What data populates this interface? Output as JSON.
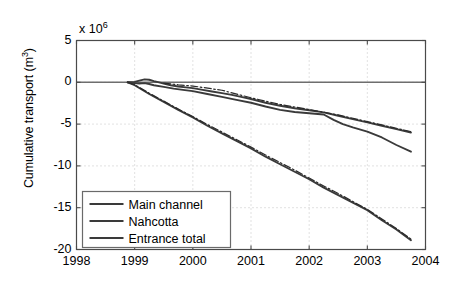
{
  "chart_data": {
    "type": "line",
    "title": "",
    "xlabel": "",
    "ylabel": "Cumulative transport (m",
    "ylabel_sup": "3",
    "ylabel_close": ")",
    "y_multiplier_prefix": "x 10",
    "y_multiplier_exp": "6",
    "xlim": [
      1998,
      2004
    ],
    "ylim": [
      -20,
      5
    ],
    "xticks": [
      "1998",
      "1999",
      "2000",
      "2001",
      "2002",
      "2003",
      "2004"
    ],
    "xtick_values": [
      1998,
      1999,
      2000,
      2001,
      2002,
      2003,
      2004
    ],
    "yticks": [
      "5",
      "0",
      "-5",
      "-10",
      "-15",
      "-20"
    ],
    "ytick_values": [
      5,
      0,
      -5,
      -10,
      -15,
      -20
    ],
    "grid": true,
    "grid_style": "dotted",
    "zero_line": true,
    "legend_position": "lower left",
    "legend": [
      "Main channel",
      "Nahcotta",
      "Entrance total"
    ],
    "series": [
      {
        "name": "Main channel",
        "style": "solid",
        "color": "#3a3a3a",
        "x": [
          1998.88,
          1999.0,
          1999.08,
          1999.17,
          1999.25,
          1999.33,
          1999.42,
          1999.5,
          1999.62,
          1999.75,
          1999.88,
          2000.0,
          2000.17,
          2000.33,
          2000.5,
          2000.67,
          2000.83,
          2001.0,
          2001.25,
          2001.5,
          2001.75,
          2002.0,
          2002.25,
          2002.5,
          2002.75,
          2003.0,
          2003.25,
          2003.5,
          2003.75
        ],
        "y": [
          0.0,
          0.05,
          0.2,
          0.35,
          0.3,
          0.15,
          0.0,
          -0.15,
          -0.35,
          -0.5,
          -0.6,
          -0.7,
          -0.9,
          -1.1,
          -1.3,
          -1.5,
          -1.75,
          -2.0,
          -2.45,
          -2.8,
          -3.1,
          -3.35,
          -3.6,
          -4.0,
          -4.4,
          -4.8,
          -5.2,
          -5.6,
          -6.0
        ]
      },
      {
        "name": "Nahcotta",
        "style": "solid",
        "color": "#3a3a3a",
        "x": [
          1998.88,
          1999.0,
          1999.08,
          1999.17,
          1999.25,
          1999.33,
          1999.5,
          1999.67,
          1999.83,
          2000.0,
          2000.25,
          2000.5,
          2000.75,
          2001.0,
          2001.25,
          2001.5,
          2001.75,
          2002.0,
          2002.25,
          2002.42,
          2002.58,
          2002.75,
          2003.0,
          2003.25,
          2003.5,
          2003.75
        ],
        "y": [
          0.0,
          -0.1,
          -0.15,
          -0.1,
          -0.2,
          -0.35,
          -0.55,
          -0.75,
          -0.9,
          -1.05,
          -1.4,
          -1.75,
          -2.1,
          -2.45,
          -2.9,
          -3.3,
          -3.55,
          -3.7,
          -3.85,
          -4.5,
          -5.0,
          -5.4,
          -5.9,
          -6.6,
          -7.5,
          -8.3
        ]
      },
      {
        "name": "Entrance total",
        "style": "solid",
        "color": "#3a3a3a",
        "x": [
          1998.88,
          1999.0,
          1999.25,
          1999.5,
          1999.75,
          2000.0,
          2000.25,
          2000.5,
          2000.75,
          2001.0,
          2001.25,
          2001.5,
          2001.75,
          2002.0,
          2002.25,
          2002.5,
          2002.75,
          2003.0,
          2003.25,
          2003.5,
          2003.75
        ],
        "y": [
          0.0,
          -0.35,
          -1.4,
          -2.35,
          -3.3,
          -4.2,
          -5.2,
          -6.1,
          -7.0,
          -7.9,
          -8.9,
          -9.8,
          -10.7,
          -11.6,
          -12.6,
          -13.5,
          -14.4,
          -15.3,
          -16.5,
          -17.6,
          -18.9
        ]
      },
      {
        "name": "Entrance total (dash-dot overlay)",
        "style": "dashdot",
        "color": "#2a2a2a",
        "x": [
          1998.88,
          1999.0,
          1999.25,
          1999.5,
          1999.75,
          2000.0,
          2000.25,
          2000.5,
          2000.75,
          2001.0,
          2001.25,
          2001.5,
          2001.75,
          2002.0,
          2002.25,
          2002.5,
          2002.75,
          2003.0,
          2003.25,
          2003.5,
          2003.75
        ],
        "y": [
          0.0,
          -0.3,
          -1.3,
          -2.25,
          -3.2,
          -4.1,
          -5.05,
          -5.95,
          -6.85,
          -7.75,
          -8.7,
          -9.6,
          -10.5,
          -11.45,
          -12.4,
          -13.3,
          -14.25,
          -15.2,
          -16.35,
          -17.5,
          -18.75
        ]
      },
      {
        "name": "Main channel (dash-dot overlay)",
        "style": "dashdot",
        "color": "#2a2a2a",
        "x": [
          1999.5,
          1999.75,
          2000.0,
          2000.5,
          2001.0,
          2001.5,
          2002.0,
          2002.5,
          2003.0,
          2003.5,
          2003.75
        ],
        "y": [
          -0.1,
          -0.3,
          -0.45,
          -0.95,
          -1.85,
          -2.65,
          -3.25,
          -3.9,
          -4.7,
          -5.5,
          -5.9
        ]
      }
    ]
  },
  "axes": {
    "y_axis_title_text": "Cumulative transport (m",
    "multiplier_text": "x 10"
  }
}
